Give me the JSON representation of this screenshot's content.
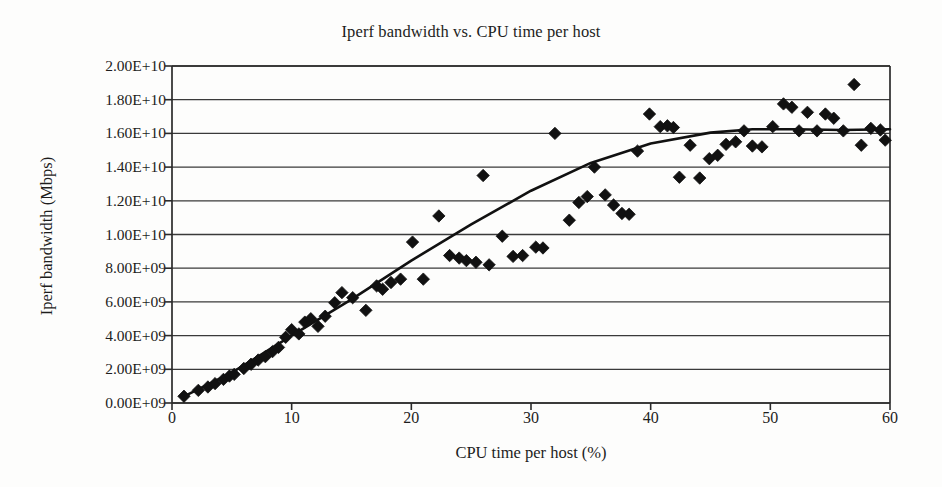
{
  "chart_data": {
    "type": "scatter",
    "title": "Iperf bandwidth vs. CPU time per host",
    "xlabel": "CPU time per host (%)",
    "ylabel": "Iperf bandwidth (Mbps)",
    "xlim": [
      0,
      60
    ],
    "ylim": [
      0,
      20000000000
    ],
    "xticks": [
      0,
      10,
      20,
      30,
      40,
      50,
      60
    ],
    "xtick_labels": [
      "0",
      "10",
      "20",
      "30",
      "40",
      "50",
      "60"
    ],
    "yticks": [
      0,
      2000000000,
      4000000000,
      6000000000,
      8000000000,
      10000000000,
      12000000000,
      14000000000,
      16000000000,
      18000000000,
      20000000000
    ],
    "ytick_labels": [
      "0.00E+09",
      "2.00E+09",
      "4.00E+09",
      "6.00E+09",
      "8.00E+09",
      "1.00E+10",
      "1.20E+10",
      "1.40E+10",
      "1.60E+10",
      "1.80E+10",
      "2.00E+10"
    ],
    "grid": "horizontal",
    "legend": "none",
    "marker": "diamond",
    "marker_color": "#111111",
    "line_color": "#111111",
    "series": [
      {
        "name": "Iperf bandwidth samples",
        "marker": "diamond",
        "points": [
          [
            1.0,
            400000000
          ],
          [
            2.2,
            750000000
          ],
          [
            3.0,
            950000000
          ],
          [
            3.6,
            1150000000
          ],
          [
            4.3,
            1400000000
          ],
          [
            4.8,
            1600000000
          ],
          [
            5.2,
            1700000000
          ],
          [
            6.0,
            2050000000
          ],
          [
            6.6,
            2300000000
          ],
          [
            7.2,
            2550000000
          ],
          [
            7.8,
            2750000000
          ],
          [
            8.4,
            3050000000
          ],
          [
            8.9,
            3300000000
          ],
          [
            9.5,
            3900000000
          ],
          [
            10.0,
            4350000000
          ],
          [
            10.6,
            4100000000
          ],
          [
            11.1,
            4800000000
          ],
          [
            11.6,
            5000000000
          ],
          [
            12.2,
            4550000000
          ],
          [
            12.8,
            5150000000
          ],
          [
            13.6,
            5950000000
          ],
          [
            14.2,
            6550000000
          ],
          [
            15.1,
            6250000000
          ],
          [
            16.2,
            5500000000
          ],
          [
            17.1,
            6950000000
          ],
          [
            17.6,
            6750000000
          ],
          [
            18.3,
            7150000000
          ],
          [
            19.1,
            7350000000
          ],
          [
            20.1,
            9550000000
          ],
          [
            21.0,
            7350000000
          ],
          [
            22.3,
            11100000000
          ],
          [
            23.2,
            8750000000
          ],
          [
            24.0,
            8600000000
          ],
          [
            24.6,
            8450000000
          ],
          [
            25.4,
            8350000000
          ],
          [
            26.0,
            13500000000
          ],
          [
            26.5,
            8200000000
          ],
          [
            27.6,
            9900000000
          ],
          [
            28.5,
            8700000000
          ],
          [
            29.3,
            8750000000
          ],
          [
            30.4,
            9250000000
          ],
          [
            31.0,
            9200000000
          ],
          [
            32.0,
            16000000000
          ],
          [
            33.2,
            10850000000
          ],
          [
            34.0,
            11900000000
          ],
          [
            34.7,
            12250000000
          ],
          [
            35.3,
            14000000000
          ],
          [
            36.2,
            12350000000
          ],
          [
            36.9,
            11750000000
          ],
          [
            37.6,
            11250000000
          ],
          [
            38.2,
            11200000000
          ],
          [
            38.9,
            14950000000
          ],
          [
            39.9,
            17150000000
          ],
          [
            40.8,
            16400000000
          ],
          [
            41.4,
            16450000000
          ],
          [
            41.9,
            16350000000
          ],
          [
            42.4,
            13400000000
          ],
          [
            43.3,
            15300000000
          ],
          [
            44.1,
            13350000000
          ],
          [
            44.9,
            14500000000
          ],
          [
            45.6,
            14700000000
          ],
          [
            46.3,
            15350000000
          ],
          [
            47.1,
            15500000000
          ],
          [
            47.8,
            16150000000
          ],
          [
            48.5,
            15250000000
          ],
          [
            49.3,
            15200000000
          ],
          [
            50.2,
            16400000000
          ],
          [
            51.1,
            17750000000
          ],
          [
            51.8,
            17550000000
          ],
          [
            52.4,
            16150000000
          ],
          [
            53.1,
            17250000000
          ],
          [
            53.9,
            16150000000
          ],
          [
            54.6,
            17150000000
          ],
          [
            55.3,
            16900000000
          ],
          [
            56.1,
            16150000000
          ],
          [
            57.0,
            18900000000
          ],
          [
            57.6,
            15300000000
          ],
          [
            58.4,
            16300000000
          ],
          [
            59.2,
            16200000000
          ],
          [
            59.6,
            15600000000
          ]
        ]
      }
    ],
    "trend_line": {
      "name": "fitted trend",
      "points": [
        [
          1.0,
          400000000
        ],
        [
          5.0,
          1800000000
        ],
        [
          10.0,
          4000000000
        ],
        [
          15.0,
          6150000000
        ],
        [
          20.0,
          8450000000
        ],
        [
          25.0,
          10600000000
        ],
        [
          30.0,
          12600000000
        ],
        [
          35.0,
          14250000000
        ],
        [
          40.0,
          15400000000
        ],
        [
          45.0,
          16050000000
        ],
        [
          48.5,
          16250000000
        ],
        [
          52.0,
          16250000000
        ],
        [
          56.0,
          16200000000
        ],
        [
          60.0,
          16250000000
        ]
      ]
    }
  },
  "figure": {
    "background_color": "#fdfdfc",
    "axis_color": "#2b2b2b",
    "grid_color": "#3a3a3a"
  }
}
